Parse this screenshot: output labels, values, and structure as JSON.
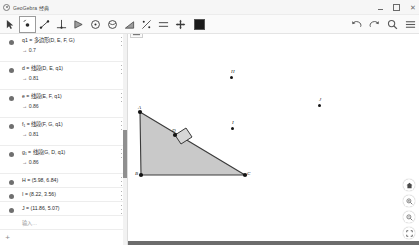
{
  "window": {
    "title": "GeoGebra 经典",
    "logo_icon": "geogebra-logo-icon",
    "controls": {
      "minimize": "minimize-icon",
      "maximize": "maximize-icon",
      "close": "close-icon"
    }
  },
  "toolbar": {
    "tools": [
      {
        "name": "move-tool",
        "icon": "arrow-cursor-icon",
        "selected": false
      },
      {
        "name": "point-tool",
        "icon": "point-icon",
        "selected": true
      },
      {
        "name": "line-tool",
        "icon": "line-icon",
        "selected": false
      },
      {
        "name": "perpendicular-line-tool",
        "icon": "perpendicular-icon",
        "selected": false
      },
      {
        "name": "polygon-tool",
        "icon": "polygon-icon",
        "selected": false
      },
      {
        "name": "circle-tool",
        "icon": "circle-icon",
        "selected": false
      },
      {
        "name": "conic-tool",
        "icon": "ellipse-icon",
        "selected": false
      },
      {
        "name": "angle-tool",
        "icon": "angle-icon",
        "selected": false
      },
      {
        "name": "reflect-tool",
        "icon": "reflect-icon",
        "selected": false
      },
      {
        "name": "slider-tool",
        "icon": "slider-icon",
        "selected": false
      },
      {
        "name": "move-graphics-tool",
        "icon": "move-cross-icon",
        "selected": false
      }
    ],
    "color_swatch": "#1a1a1a",
    "right_icons": [
      {
        "name": "undo-button",
        "icon": "undo-icon"
      },
      {
        "name": "redo-button",
        "icon": "redo-icon"
      },
      {
        "name": "search-button",
        "icon": "search-icon"
      },
      {
        "name": "main-menu-button",
        "icon": "hamburger-menu-icon"
      }
    ]
  },
  "algebra": {
    "rows": [
      {
        "def": "q1 = 多边形(D, E, F, G)",
        "value": "→ 0.7",
        "dot_color": "#6f6f6f"
      },
      {
        "def": "d = 线段(D, E, q1)",
        "value": "→ 0.81",
        "dot_color": "#6f6f6f"
      },
      {
        "def": "e = 线段(E, F, q1)",
        "value": "→ 0.86",
        "dot_color": "#6f6f6f"
      },
      {
        "def": "f₁ = 线段(F, G, q1)",
        "value": "→ 0.81",
        "dot_color": "#6f6f6f"
      },
      {
        "def": "g₁ = 线段(G, D, q1)",
        "value": "→ 0.86",
        "dot_color": "#6f6f6f"
      },
      {
        "def": "H = (5.98, 6.84)",
        "value": "",
        "dot_color": "#6f6f6f"
      },
      {
        "def": "I = (8.22, 3.56)",
        "value": "",
        "dot_color": "#6f6f6f"
      },
      {
        "def": "J = (11.86, 5.07)",
        "value": "",
        "dot_color": "#6f6f6f"
      }
    ],
    "input_placeholder": "输入…",
    "add_button": "+",
    "row_menu_icon": "kebab-menu-icon"
  },
  "graphics": {
    "stylebar_icon": "stylebar-toggle-icon",
    "triangle": {
      "fill": "#c9c9c9",
      "stroke": "#3a3a3a",
      "vertices": [
        {
          "label": "A",
          "x": 12,
          "y": 8
        },
        {
          "label": "B",
          "x": 13,
          "y": 71
        },
        {
          "label": "C",
          "x": 117,
          "y": 71
        }
      ]
    },
    "square": {
      "label": "D",
      "fill": "#d4d4d4",
      "stroke": "#3a3a3a",
      "anchor": {
        "x": 47,
        "y": 31
      }
    },
    "free_points": [
      {
        "label": "H",
        "x": 102,
        "y": 19
      },
      {
        "label": "I",
        "x": 103,
        "y": 70
      },
      {
        "label": "J",
        "x": 190,
        "y": 47
      }
    ],
    "view_controls": [
      {
        "name": "reset-view-button",
        "icon": "home-icon"
      },
      {
        "name": "zoom-in-button",
        "icon": "zoom-in-icon"
      },
      {
        "name": "zoom-out-button",
        "icon": "zoom-out-icon"
      },
      {
        "name": "fullscreen-button",
        "icon": "fullscreen-icon"
      }
    ]
  }
}
